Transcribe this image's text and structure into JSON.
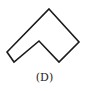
{
  "figure": {
    "label": "(D)",
    "shape": "chevron-notched-polygon",
    "stroke_color": "#1a1a1a",
    "points": "49,9 79,42 59,62 39,41 14,62 7,52"
  }
}
